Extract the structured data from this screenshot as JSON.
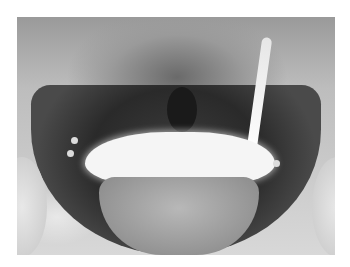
{
  "image": {
    "type": "radiograph",
    "description": "Grayscale pelvic X-ray with contrast-filled bladder and opacified ureter",
    "colors": {
      "background": "#ffffff",
      "dark_soft_tissue": "#2a2a2a",
      "contrast": "#f5f5f5",
      "bone": "#d8d8d8"
    }
  }
}
